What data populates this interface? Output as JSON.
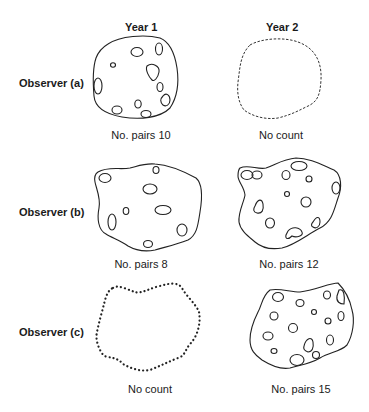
{
  "columns": [
    {
      "label": "Year 1"
    },
    {
      "label": "Year 2"
    }
  ],
  "rows": [
    {
      "label": "Observer (a)",
      "cells": [
        {
          "caption": "No. pairs 10",
          "pairs": 10,
          "outline": "solid"
        },
        {
          "caption": "No count",
          "pairs": null,
          "outline": "dashed"
        }
      ]
    },
    {
      "label": "Observer (b)",
      "cells": [
        {
          "caption": "No. pairs 8",
          "pairs": 8,
          "outline": "solid"
        },
        {
          "caption": "No. pairs 12",
          "pairs": 12,
          "outline": "solid"
        }
      ]
    },
    {
      "label": "Observer (c)",
      "cells": [
        {
          "caption": "No count",
          "pairs": null,
          "outline": "dotted"
        },
        {
          "caption": "No. pairs 15",
          "pairs": 15,
          "outline": "solid"
        }
      ]
    }
  ]
}
